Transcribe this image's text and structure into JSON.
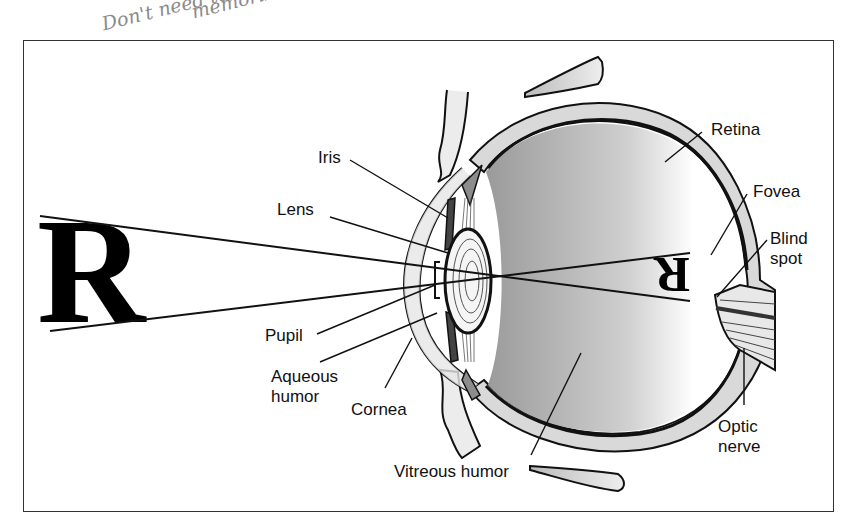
{
  "annotation": {
    "handwritten_note_line1": "Don't need to",
    "handwritten_note_line2": "memorize"
  },
  "diagram": {
    "object_letter": "R",
    "image_letter": "R",
    "labels": {
      "iris": "Iris",
      "lens": "Lens",
      "pupil": "Pupil",
      "aqueous_humor": "Aqueous humor",
      "cornea": "Cornea",
      "retina": "Retina",
      "fovea": "Fovea",
      "blind_spot": "Blind spot",
      "optic_nerve": "Optic nerve",
      "vitreous_humor": "Vitreous humor"
    },
    "colors": {
      "outline": "#111111",
      "sclera_fill": "#d9d9d9",
      "iris_fill": "#444444",
      "ciliary_fill": "#8c8c8c",
      "frame": "#333333"
    }
  }
}
